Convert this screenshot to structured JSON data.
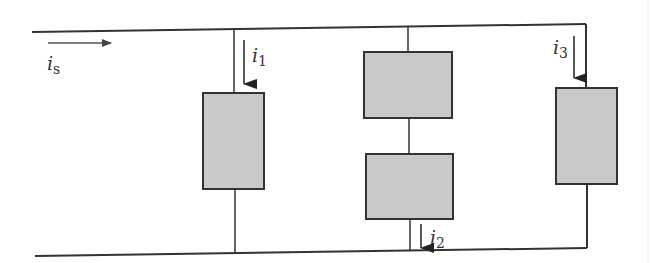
{
  "diagram": {
    "type": "parallel circuit",
    "colors": {
      "wire": "#333333",
      "element_fill": "#c9c9c9",
      "element_border": "#333333",
      "arrow": "#555555"
    },
    "source_current": {
      "label_main": "i",
      "label_sub": "s"
    },
    "branches": [
      {
        "id": "branch-1",
        "current": {
          "label_main": "i",
          "label_sub": "1"
        },
        "elements": 1
      },
      {
        "id": "branch-2",
        "current": {
          "label_main": "i",
          "label_sub": "2"
        },
        "elements": 2
      },
      {
        "id": "branch-3",
        "current": {
          "label_main": "i",
          "label_sub": "3"
        },
        "elements": 1
      }
    ]
  }
}
